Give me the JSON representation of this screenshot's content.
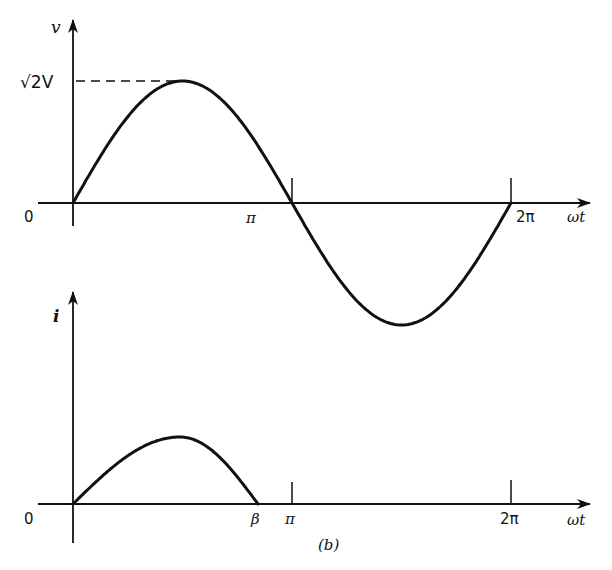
{
  "chart_data": [
    {
      "type": "line",
      "title": "",
      "xlabel": "ωt",
      "ylabel": "v",
      "x_ticks": [
        "0",
        "π",
        "2π"
      ],
      "y_ticks": [
        "√2V"
      ],
      "peak_label": "√2V",
      "grid": false,
      "legend": null,
      "series": [
        {
          "name": "v",
          "description": "sinusoidal voltage v = √2V sin(ωt)",
          "x": [
            "0",
            "π/2",
            "π",
            "3π/2",
            "2π"
          ],
          "values": [
            0,
            1.414,
            0,
            -1.414,
            0
          ],
          "amplitude": "√2V"
        }
      ],
      "xlim": [
        "0",
        "2π"
      ],
      "annotations": [
        "dashed reference line from v-axis at √2V to peak"
      ]
    },
    {
      "type": "line",
      "title": "",
      "xlabel": "ωt",
      "ylabel": "i",
      "x_ticks": [
        "0",
        "β",
        "π",
        "2π"
      ],
      "grid": false,
      "legend": null,
      "series": [
        {
          "name": "i",
          "description": "current pulse starting at 0, peaking before π/2, returning to zero at extinction angle β (< π); zero elsewhere",
          "x": [
            "0",
            "peak",
            "β"
          ],
          "values": [
            0,
            0.6,
            0
          ]
        }
      ],
      "xlim": [
        "0",
        "2π"
      ]
    }
  ],
  "labels": {
    "v_axis": "v",
    "i_axis": "i",
    "peak": "√2V",
    "zero_top": "0",
    "pi_top": "π",
    "two_pi_top": "2π",
    "wt_top": "ωt",
    "zero_bottom": "0",
    "beta": "β",
    "pi_bottom": "π",
    "two_pi_bottom": "2π",
    "wt_bottom": "ωt",
    "caption": "(b)"
  }
}
